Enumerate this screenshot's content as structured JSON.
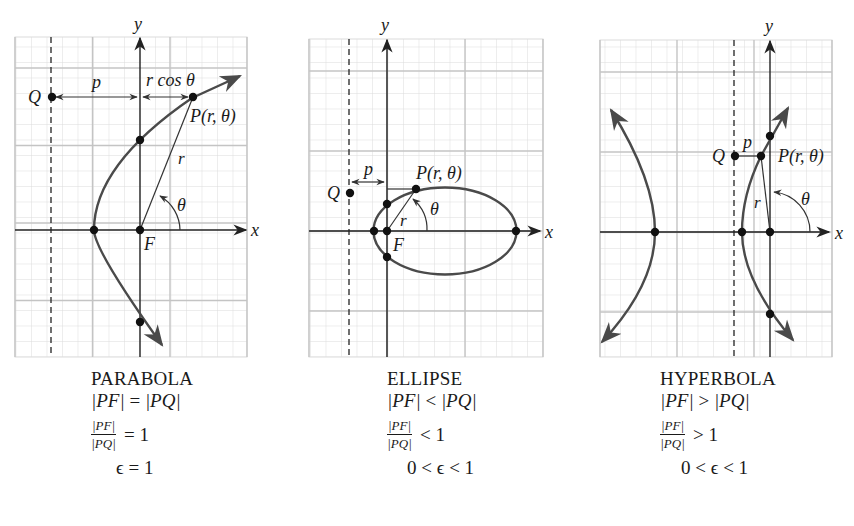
{
  "figure": {
    "colors": {
      "grid_minor": "#dcdcdc",
      "grid_major": "#c8c8c8",
      "axis": "#222222",
      "curve": "#4a4a4a",
      "point": "#111111",
      "text": "#1a1a1a"
    },
    "panels": [
      {
        "id": "parabola",
        "axis_labels": {
          "x": "x",
          "y": "y"
        },
        "labels": {
          "focus": "F",
          "directrix_point": "Q",
          "point": "P(r, θ)",
          "distance_p": "p",
          "projection": "r cos θ",
          "radius": "r",
          "angle": "θ"
        },
        "caption": {
          "title": "PARABOLA",
          "relation_lhs": "|PF|",
          "relation_op": "=",
          "relation_rhs": "|PQ|",
          "ratio_num": "|PF|",
          "ratio_den": "|PQ|",
          "ratio_rhs": "= 1",
          "eccentricity": "ϵ = 1"
        }
      },
      {
        "id": "ellipse",
        "axis_labels": {
          "x": "x",
          "y": "y"
        },
        "labels": {
          "focus": "F",
          "directrix_point": "Q",
          "point": "P(r, θ)",
          "distance_p": "p",
          "radius": "r",
          "angle": "θ"
        },
        "caption": {
          "title": "ELLIPSE",
          "relation_lhs": "|PF|",
          "relation_op": "<",
          "relation_rhs": "|PQ|",
          "ratio_num": "|PF|",
          "ratio_den": "|PQ|",
          "ratio_rhs": "< 1",
          "eccentricity": "0 < ϵ < 1"
        }
      },
      {
        "id": "hyperbola",
        "axis_labels": {
          "x": "x",
          "y": "y"
        },
        "labels": {
          "directrix_point": "Q",
          "point": "P(r, θ)",
          "distance_p": "p",
          "radius": "r",
          "angle": "θ"
        },
        "caption": {
          "title": "HYPERBOLA",
          "relation_lhs": "|PF|",
          "relation_op": ">",
          "relation_rhs": "|PQ|",
          "ratio_num": "|PF|",
          "ratio_den": "|PQ|",
          "ratio_rhs": "> 1",
          "eccentricity": "0 < ϵ < 1"
        }
      }
    ]
  }
}
